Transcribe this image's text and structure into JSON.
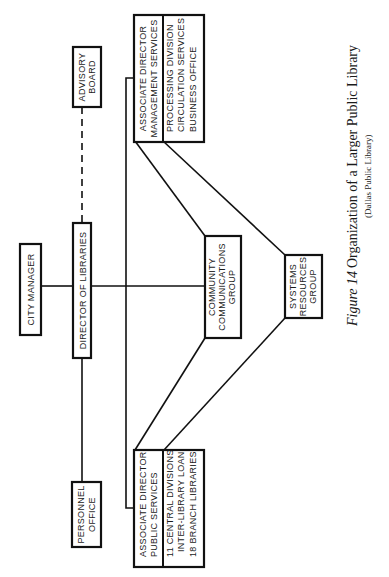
{
  "diagram": {
    "orientation": "rotated-90-ccw",
    "nodes": {
      "city_manager": {
        "label": "CITY MANAGER"
      },
      "director": {
        "label": "DIRECTOR OF LIBRARIES"
      },
      "advisory_board": {
        "lines": [
          "ADVISORY",
          "BOARD"
        ]
      },
      "personnel_office": {
        "lines": [
          "PERSONNEL",
          "OFFICE"
        ]
      },
      "community_communications": {
        "lines": [
          "COMMUNITY",
          "COMMUNICATIONS",
          "GROUP"
        ]
      },
      "systems_resources": {
        "lines": [
          "SYSTEMS",
          "RESOURCES",
          "GROUP"
        ]
      },
      "assoc_management": {
        "title_lines": [
          "ASSOCIATE DIRECTOR",
          "MANAGEMENT SERVICES"
        ],
        "unit_lines": [
          "PROCESSING DIVISION",
          "CIRCULATION SERVICES",
          "BUSINESS OFFICE"
        ]
      },
      "assoc_public": {
        "title_lines": [
          "ASSOCIATE DIRECTOR",
          "PUBLIC SERVICES"
        ],
        "unit_lines": [
          "11 CENTRAL DIVISIONS",
          "INTER-LIBRARY LOAN",
          "18 BRANCH LIBRARIES"
        ]
      }
    },
    "edges": [
      {
        "from": "city_manager",
        "to": "director",
        "style": "solid"
      },
      {
        "from": "director",
        "to": "advisory_board",
        "style": "dashed"
      },
      {
        "from": "director",
        "to": "personnel_office",
        "style": "solid"
      },
      {
        "from": "director",
        "to": "community_communications",
        "style": "solid"
      },
      {
        "from": "director",
        "to": "assoc_management",
        "style": "solid"
      },
      {
        "from": "director",
        "to": "assoc_public",
        "style": "solid"
      },
      {
        "from": "assoc_management",
        "to": "community_communications",
        "style": "solid"
      },
      {
        "from": "assoc_management",
        "to": "systems_resources",
        "style": "solid"
      },
      {
        "from": "assoc_public",
        "to": "community_communications",
        "style": "solid"
      },
      {
        "from": "assoc_public",
        "to": "systems_resources",
        "style": "solid"
      }
    ]
  },
  "caption": {
    "figure_label": "Figure 14",
    "title": "Organization of a Larger Public Library",
    "subtitle": "(Dallas Public Library)"
  }
}
